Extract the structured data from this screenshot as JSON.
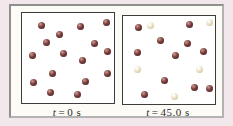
{
  "figure": {
    "colors": {
      "background": "#f2e8ec",
      "frame_fill": "#fdfbf5",
      "frame_border_dark": "#8f8f8f",
      "frame_border_light": "#b3b3b3",
      "box_fill": "#ffffff",
      "box_border": "#3c3c3c",
      "parent_dot": "#7a3b3b",
      "decayed_dot": "#e6dcba"
    },
    "panels": [
      {
        "id": "t0",
        "label": {
          "symbol": "t",
          "equals": "=",
          "value": "0 s"
        },
        "parent_count": 16,
        "decayed_count": 0,
        "dots": [
          {
            "x": 19,
            "y": 12,
            "type": "parent"
          },
          {
            "x": 58,
            "y": 13,
            "type": "parent"
          },
          {
            "x": 84,
            "y": 9,
            "type": "parent"
          },
          {
            "x": 37,
            "y": 21,
            "type": "parent"
          },
          {
            "x": 24,
            "y": 29,
            "type": "parent"
          },
          {
            "x": 72,
            "y": 30,
            "type": "parent"
          },
          {
            "x": 85,
            "y": 38,
            "type": "parent"
          },
          {
            "x": 10,
            "y": 42,
            "type": "parent"
          },
          {
            "x": 41,
            "y": 40,
            "type": "parent"
          },
          {
            "x": 60,
            "y": 47,
            "type": "parent"
          },
          {
            "x": 30,
            "y": 60,
            "type": "parent"
          },
          {
            "x": 85,
            "y": 60,
            "type": "parent"
          },
          {
            "x": 11,
            "y": 69,
            "type": "parent"
          },
          {
            "x": 63,
            "y": 68,
            "type": "parent"
          },
          {
            "x": 28,
            "y": 79,
            "type": "parent"
          },
          {
            "x": 55,
            "y": 81,
            "type": "parent"
          }
        ]
      },
      {
        "id": "t45",
        "label": {
          "symbol": "t",
          "equals": "=",
          "value": "45.0 s"
        },
        "parent_count": 11,
        "decayed_count": 5,
        "dots": [
          {
            "x": 15,
            "y": 11,
            "type": "parent"
          },
          {
            "x": 27,
            "y": 9,
            "type": "decayed"
          },
          {
            "x": 66,
            "y": 8,
            "type": "parent"
          },
          {
            "x": 86,
            "y": 6,
            "type": "decayed"
          },
          {
            "x": 37,
            "y": 24,
            "type": "parent"
          },
          {
            "x": 64,
            "y": 27,
            "type": "parent"
          },
          {
            "x": 80,
            "y": 35,
            "type": "parent"
          },
          {
            "x": 14,
            "y": 36,
            "type": "parent"
          },
          {
            "x": 52,
            "y": 39,
            "type": "parent"
          },
          {
            "x": 14,
            "y": 53,
            "type": "decayed"
          },
          {
            "x": 76,
            "y": 53,
            "type": "decayed"
          },
          {
            "x": 41,
            "y": 64,
            "type": "parent"
          },
          {
            "x": 71,
            "y": 71,
            "type": "parent"
          },
          {
            "x": 86,
            "y": 72,
            "type": "parent"
          },
          {
            "x": 21,
            "y": 78,
            "type": "parent"
          },
          {
            "x": 51,
            "y": 80,
            "type": "decayed"
          }
        ]
      }
    ]
  }
}
